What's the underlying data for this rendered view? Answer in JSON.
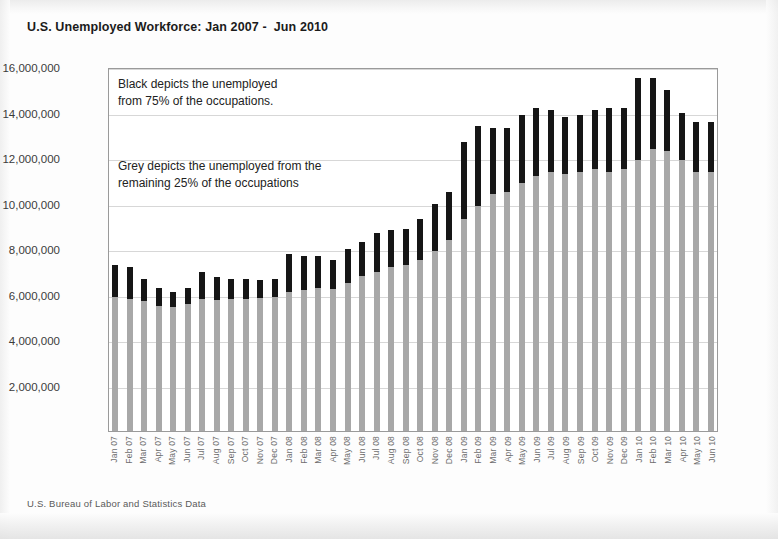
{
  "title": "U.S. Unemployed Workforce: Jan 2007 -  Jun 2010",
  "source_note": "U.S. Bureau of Labor and Statistics Data",
  "annotations": {
    "black": "Black depicts the unemployed\nfrom 75% of the occupations.",
    "grey": "Grey depicts the unemployed from the\nremaining 25% of the occupations"
  },
  "colors": {
    "black_series": "#161616",
    "grey_series": "#a8a8a8",
    "gridline": "#d7d7d7",
    "frame": "#9a9a9a",
    "title_text": "#1b1b1b",
    "axis_text": "#6d6d6d"
  },
  "chart_data": {
    "type": "bar",
    "stacked": true,
    "title": "U.S. Unemployed Workforce: Jan 2007 -  Jun 2010",
    "xlabel": "",
    "ylabel": "",
    "ylim": [
      0,
      16000000
    ],
    "ytick_step": 2000000,
    "ytick_labels": [
      "16,000,000",
      "14,000,000",
      "12,000,000",
      "10,000,000",
      "8,000,000",
      "6,000,000",
      "4,000,000",
      "2,000,000"
    ],
    "ytick_values": [
      16000000,
      14000000,
      12000000,
      10000000,
      8000000,
      6000000,
      4000000,
      2000000
    ],
    "grid": true,
    "legend": "none",
    "categories": [
      "Jan 07",
      "Feb 07",
      "Mar 07",
      "Apr 07",
      "May 07",
      "Jun 07",
      "Jul 07",
      "Aug 07",
      "Sep 07",
      "Oct 07",
      "Nov 07",
      "Dec 07",
      "Jan 08",
      "Feb 08",
      "Mar 08",
      "Apr 08",
      "May 08",
      "Jun 08",
      "Jul 08",
      "Aug 08",
      "Sep 08",
      "Oct 08",
      "Nov 08",
      "Dec 08",
      "Jan 09",
      "Feb 09",
      "Mar 09",
      "Apr 09",
      "May 09",
      "Jun 09",
      "Jul 09",
      "Aug 09",
      "Sep 09",
      "Oct 09",
      "Nov 09",
      "Dec 09",
      "Jan 10",
      "Feb 10",
      "Mar 10",
      "Apr 10",
      "May 10",
      "Jun 10"
    ],
    "series": [
      {
        "name": "Grey depicts the unemployed from the remaining 25% of the occupations",
        "color": "#a8a8a8",
        "values": [
          5900000,
          5800000,
          5700000,
          5500000,
          5450000,
          5600000,
          5800000,
          5750000,
          5800000,
          5800000,
          5850000,
          5900000,
          6100000,
          6200000,
          6300000,
          6250000,
          6500000,
          6800000,
          7000000,
          7200000,
          7300000,
          7500000,
          7900000,
          8400000,
          9300000,
          9900000,
          10400000,
          10500000,
          10900000,
          11200000,
          11400000,
          11300000,
          11400000,
          11500000,
          11400000,
          11500000,
          11900000,
          12400000,
          12300000,
          11900000,
          11400000,
          11400000
        ]
      },
      {
        "name": "Black depicts the unemployed from 75% of the occupations.",
        "color": "#161616",
        "values": [
          1400000,
          1400000,
          1000000,
          800000,
          650000,
          700000,
          1200000,
          1000000,
          900000,
          900000,
          800000,
          800000,
          1700000,
          1500000,
          1400000,
          1250000,
          1500000,
          1500000,
          1700000,
          1650000,
          1600000,
          1800000,
          2100000,
          2100000,
          3400000,
          3500000,
          2900000,
          2800000,
          3000000,
          3000000,
          2700000,
          2500000,
          2500000,
          2600000,
          2800000,
          2700000,
          3600000,
          3100000,
          2700000,
          2100000,
          2200000,
          2200000
        ]
      }
    ],
    "totals": [
      7300000,
      7200000,
      6700000,
      6300000,
      6100000,
      6300000,
      7000000,
      6750000,
      6700000,
      6700000,
      6650000,
      6700000,
      7800000,
      7700000,
      7700000,
      7500000,
      8000000,
      8300000,
      8700000,
      8850000,
      8900000,
      9300000,
      10000000,
      10500000,
      12700000,
      13400000,
      13300000,
      13300000,
      13900000,
      14200000,
      14100000,
      13800000,
      13900000,
      14100000,
      14200000,
      14200000,
      15500000,
      15500000,
      15000000,
      14000000,
      13600000,
      13600000
    ]
  }
}
